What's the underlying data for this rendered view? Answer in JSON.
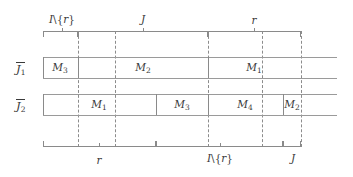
{
  "figure": {
    "title_hidden": "interval exchange diagram",
    "colors": {
      "ink": "#3a3a3a",
      "rule": "#9a9a9a",
      "dashed": "#8c8c8c",
      "background": "#ffffff"
    }
  },
  "top_brackets": [
    {
      "id": "top-bracket-1",
      "label": "I\\{r}",
      "label_x": 62,
      "x": 43,
      "width": 35
    },
    {
      "id": "top-bracket-2",
      "label": "J",
      "label_x": 143,
      "x": 78,
      "width": 130
    },
    {
      "id": "top-bracket-3",
      "label": "r",
      "label_x": 254,
      "x": 208,
      "width": 93
    }
  ],
  "top_ticks": [
    {
      "id": "top-tick-1",
      "x": 62
    },
    {
      "id": "top-tick-2",
      "x": 143
    },
    {
      "id": "top-tick-3",
      "x": 254
    }
  ],
  "bottom_brackets": [
    {
      "id": "bottom-bracket-1",
      "label": "r",
      "label_x": 99,
      "x": 43,
      "width": 113
    },
    {
      "id": "bottom-bracket-2",
      "label": "I\\{r}",
      "label_x": 220,
      "x": 156,
      "width": 127
    },
    {
      "id": "bottom-bracket-3",
      "label": "J",
      "label_x": 292,
      "x": 283,
      "width": 18
    }
  ],
  "bottom_ticks": [
    {
      "id": "bottom-tick-1",
      "x": 99
    },
    {
      "id": "bottom-tick-2",
      "x": 220
    }
  ],
  "dashed_guides": [
    {
      "id": "guide-1",
      "x": 78
    },
    {
      "id": "guide-2",
      "x": 115
    },
    {
      "id": "guide-3",
      "x": 208
    },
    {
      "id": "guide-4",
      "x": 262
    },
    {
      "id": "guide-5",
      "x": 301
    }
  ],
  "rows": [
    {
      "id": "row-J1",
      "label": "J",
      "label_sub": "1",
      "label_x": 16,
      "label_y": 69,
      "overline_x": 16,
      "overline_width": 9,
      "overline_y": 62,
      "bar": {
        "x": 43,
        "y": 57,
        "width": 258,
        "height": 21,
        "extend_to": 337
      },
      "dividers": [
        78,
        208
      ],
      "segments": [
        {
          "id": "segment-J1-M3",
          "label": "M",
          "sub": "3",
          "center_x": 60,
          "from": 43,
          "to": 78
        },
        {
          "id": "segment-J1-M2",
          "label": "M",
          "sub": "2",
          "center_x": 143,
          "from": 78,
          "to": 208
        },
        {
          "id": "segment-J1-M1",
          "label": "M",
          "sub": "1",
          "center_x": 254,
          "from": 208,
          "to": 301
        }
      ]
    },
    {
      "id": "row-J2",
      "label": "J",
      "label_sub": "2",
      "label_x": 16,
      "label_y": 106,
      "overline_x": 16,
      "overline_width": 9,
      "overline_y": 99,
      "bar": {
        "x": 43,
        "y": 94,
        "width": 258,
        "height": 21,
        "extend_to": 337
      },
      "dividers": [
        156,
        208,
        283
      ],
      "segments": [
        {
          "id": "segment-J2-M1",
          "label": "M",
          "sub": "1",
          "center_x": 99,
          "from": 43,
          "to": 156
        },
        {
          "id": "segment-J2-M3",
          "label": "M",
          "sub": "3",
          "center_x": 182,
          "from": 156,
          "to": 208
        },
        {
          "id": "segment-J2-M4",
          "label": "M",
          "sub": "4",
          "center_x": 245,
          "from": 208,
          "to": 283
        },
        {
          "id": "segment-J2-M2",
          "label": "M",
          "sub": "2",
          "center_x": 292,
          "from": 283,
          "to": 301
        }
      ]
    }
  ],
  "geometry": {
    "top_bracket_y": 31,
    "top_label_y": 14,
    "bottom_bracket_y": 141,
    "bottom_label_y": 154,
    "guide_top": 31,
    "guide_bottom": 147
  }
}
